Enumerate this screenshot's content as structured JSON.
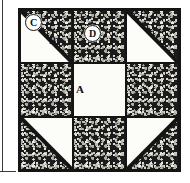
{
  "figure": {
    "kind": "quilt-block-diagram",
    "name": "Shoofly quilt block",
    "grid": "3x3"
  },
  "colors": {
    "fabric_dark": "#1b1b1b",
    "fabric_light": "#fcfcf9",
    "seam_line": "#141414",
    "page_rule": "#3a3a3a"
  },
  "patches": [
    {
      "id": "top-left",
      "type": "half-square-triangle",
      "light_corner": "lower-left",
      "dark_corner": "upper-right"
    },
    {
      "id": "top-center",
      "type": "square",
      "fabric": "dark"
    },
    {
      "id": "top-right",
      "type": "half-square-triangle",
      "light_corner": "lower-left",
      "dark_corner": "upper-right"
    },
    {
      "id": "middle-left",
      "type": "square",
      "fabric": "dark"
    },
    {
      "id": "center",
      "type": "square",
      "fabric": "light"
    },
    {
      "id": "middle-right",
      "type": "square",
      "fabric": "dark"
    },
    {
      "id": "bottom-left",
      "type": "half-square-triangle",
      "light_corner": "upper-right",
      "dark_corner": "lower-left"
    },
    {
      "id": "bottom-center",
      "type": "square",
      "fabric": "dark"
    },
    {
      "id": "bottom-right",
      "type": "half-square-triangle",
      "light_corner": "upper-left",
      "dark_corner": "lower-right"
    }
  ],
  "labels": {
    "a": {
      "text": "A",
      "style": "plain",
      "refers_to": "center-light-square"
    },
    "b": {
      "text": "B",
      "style": "plain",
      "refers_to": "top-left-light-triangle"
    },
    "c": {
      "text": "C",
      "style": "circled",
      "refers_to": "top-left-dark-triangle"
    },
    "d": {
      "text": "D",
      "style": "circled",
      "refers_to": "top-center-dark-square"
    }
  },
  "page_rules": {
    "vertical_rule": "left-margin-rule",
    "horizontal_rule": "bottom-margin-rule"
  }
}
